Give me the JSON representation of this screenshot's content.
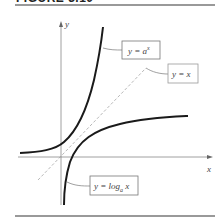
{
  "figure": {
    "title": "FIGURE 3.10"
  },
  "axes": {
    "x_label": "x",
    "y_label": "y"
  },
  "curves": [
    {
      "name": "exponential",
      "label_prefix": "y = a",
      "label_sup": "x"
    },
    {
      "name": "identity",
      "label": "y = x"
    },
    {
      "name": "logarithm",
      "label_prefix": "y = log",
      "label_sub": "a",
      "label_suffix": " x"
    }
  ],
  "colors": {
    "curve": "#1a1a1a",
    "axis": "#888888",
    "rule": "#777777",
    "dashed": "#999999"
  }
}
